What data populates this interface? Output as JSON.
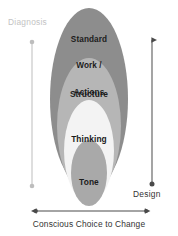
{
  "diagram": {
    "rings": [
      {
        "id": "standard-work-actions",
        "label_lines": [
          "Standard",
          "Work /",
          "Actions"
        ],
        "label": "Standard Work / Actions",
        "fill": "#8d8d8d",
        "depth": 1
      },
      {
        "id": "structure",
        "label_lines": [
          "Structure"
        ],
        "label": "Structure",
        "fill": "#b6b6b6",
        "depth": 2
      },
      {
        "id": "thinking",
        "label_lines": [
          "Thinking"
        ],
        "label": "Thinking",
        "fill": "#f3f3f3",
        "depth": 3
      },
      {
        "id": "tone",
        "label_lines": [
          "Tone"
        ],
        "label": "Tone",
        "fill": "#a9a9a9",
        "depth": 4
      }
    ],
    "axes": {
      "left": {
        "label": "Diagnosis",
        "color": "#c3c3c3",
        "start_cap": "dot",
        "end_cap": "dot",
        "orientation": "vertical"
      },
      "right": {
        "label": "Design",
        "color": "#4a4a4a",
        "start_cap": "arrow",
        "end_cap": "dot",
        "orientation": "vertical"
      },
      "bottom": {
        "label": "Conscious Choice to Change",
        "color": "#4a4a4a",
        "start_cap": "arrow",
        "end_cap": "arrow",
        "orientation": "horizontal"
      }
    },
    "background": "#ffffff"
  }
}
